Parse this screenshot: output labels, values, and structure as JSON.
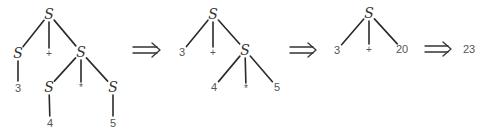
{
  "diagram": {
    "title": "",
    "nonterminal": "S",
    "result": "23",
    "trees": [
      {
        "id": "tree-1",
        "nodes": [
          {
            "id": "t1-root",
            "label": "S",
            "kind": "nonterminal",
            "x": 49,
            "y": 14
          },
          {
            "id": "t1-s-left",
            "label": "S",
            "kind": "nonterminal",
            "x": 18,
            "y": 53
          },
          {
            "id": "t1-plus",
            "label": "+",
            "kind": "operator",
            "x": 49,
            "y": 53
          },
          {
            "id": "t1-s-right",
            "label": "S",
            "kind": "nonterminal",
            "x": 81,
            "y": 52
          },
          {
            "id": "t1-three",
            "label": "3",
            "kind": "terminal",
            "x": 18,
            "y": 88
          },
          {
            "id": "t1-s-four",
            "label": "S",
            "kind": "nonterminal",
            "x": 49,
            "y": 87
          },
          {
            "id": "t1-times",
            "label": "*",
            "kind": "operator",
            "x": 81,
            "y": 87
          },
          {
            "id": "t1-s-five",
            "label": "S",
            "kind": "nonterminal",
            "x": 113,
            "y": 87
          },
          {
            "id": "t1-four",
            "label": "4",
            "kind": "terminal",
            "x": 50,
            "y": 123
          },
          {
            "id": "t1-five",
            "label": "5",
            "kind": "terminal",
            "x": 113,
            "y": 123
          }
        ],
        "edges": [
          [
            "t1-root",
            "t1-s-left"
          ],
          [
            "t1-root",
            "t1-plus"
          ],
          [
            "t1-root",
            "t1-s-right"
          ],
          [
            "t1-s-left",
            "t1-three"
          ],
          [
            "t1-s-right",
            "t1-s-four"
          ],
          [
            "t1-s-right",
            "t1-times"
          ],
          [
            "t1-s-right",
            "t1-s-five"
          ],
          [
            "t1-s-four",
            "t1-four"
          ],
          [
            "t1-s-five",
            "t1-five"
          ]
        ]
      },
      {
        "id": "tree-2",
        "nodes": [
          {
            "id": "t2-root",
            "label": "S",
            "kind": "nonterminal",
            "x": 213,
            "y": 14
          },
          {
            "id": "t2-three",
            "label": "3",
            "kind": "terminal",
            "x": 182,
            "y": 52
          },
          {
            "id": "t2-plus",
            "label": "+",
            "kind": "operator",
            "x": 213,
            "y": 52
          },
          {
            "id": "t2-s-right",
            "label": "S",
            "kind": "nonterminal",
            "x": 245,
            "y": 50
          },
          {
            "id": "t2-four",
            "label": "4",
            "kind": "terminal",
            "x": 214,
            "y": 87
          },
          {
            "id": "t2-times",
            "label": "*",
            "kind": "operator",
            "x": 246,
            "y": 88
          },
          {
            "id": "t2-five",
            "label": "5",
            "kind": "terminal",
            "x": 277,
            "y": 87
          }
        ],
        "edges": [
          [
            "t2-root",
            "t2-three"
          ],
          [
            "t2-root",
            "t2-plus"
          ],
          [
            "t2-root",
            "t2-s-right"
          ],
          [
            "t2-s-right",
            "t2-four"
          ],
          [
            "t2-s-right",
            "t2-times"
          ],
          [
            "t2-s-right",
            "t2-five"
          ]
        ]
      },
      {
        "id": "tree-3",
        "nodes": [
          {
            "id": "t3-root",
            "label": "S",
            "kind": "nonterminal",
            "x": 369,
            "y": 13
          },
          {
            "id": "t3-three",
            "label": "3",
            "kind": "terminal",
            "x": 337,
            "y": 50
          },
          {
            "id": "t3-plus",
            "label": "+",
            "kind": "operator",
            "x": 369,
            "y": 49
          },
          {
            "id": "t3-twenty",
            "label": "20",
            "kind": "terminal",
            "x": 402,
            "y": 49
          }
        ],
        "edges": [
          [
            "t3-root",
            "t3-three"
          ],
          [
            "t3-root",
            "t3-plus"
          ],
          [
            "t3-root",
            "t3-twenty"
          ]
        ]
      }
    ],
    "arrows": [
      {
        "id": "arrow-1",
        "symbol": "⇒",
        "x1": 133,
        "x2": 160,
        "y": 50
      },
      {
        "id": "arrow-2",
        "symbol": "⇒",
        "x1": 290,
        "x2": 316,
        "y": 50
      },
      {
        "id": "arrow-3",
        "symbol": "⇒",
        "x1": 425,
        "x2": 451,
        "y": 49
      }
    ],
    "final": {
      "label": "23",
      "x": 469,
      "y": 49
    }
  }
}
